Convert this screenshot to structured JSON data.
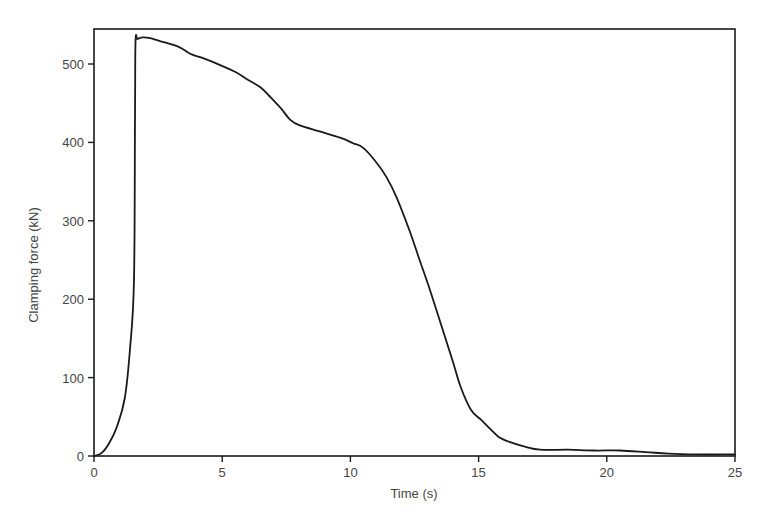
{
  "chart_data": {
    "type": "line",
    "title": "",
    "xlabel": "Time (s)",
    "ylabel": "Clamping force (kN)",
    "xlim": [
      0,
      25
    ],
    "ylim": [
      0,
      545
    ],
    "xticks": [
      0,
      5,
      10,
      15,
      20,
      25
    ],
    "yticks": [
      0,
      100,
      200,
      300,
      400,
      500
    ],
    "xtick_labels": [
      "0",
      "5",
      "10",
      "15",
      "20",
      "25"
    ],
    "ytick_labels": [
      "0",
      "100",
      "200",
      "300",
      "400",
      "500"
    ],
    "grid": false,
    "legend": null,
    "series": [
      {
        "name": "Clamping force",
        "color": "#1a1a1a",
        "x": [
          0.0,
          0.3,
          0.6,
          0.9,
          1.2,
          1.4,
          1.56,
          1.6,
          1.62,
          1.7,
          1.9,
          2.2,
          2.6,
          3.3,
          3.75,
          4.2,
          4.9,
          5.5,
          6.0,
          6.5,
          6.9,
          7.3,
          7.65,
          8.0,
          8.8,
          9.6,
          10.1,
          10.5,
          11.0,
          11.4,
          11.8,
          12.3,
          12.7,
          13.1,
          13.6,
          14.0,
          14.3,
          14.7,
          15.1,
          15.5,
          15.8,
          16.2,
          16.8,
          17.4,
          18.5,
          19.5,
          20.5,
          21.5,
          22.4,
          23.5,
          24.8,
          25.0
        ],
        "y": [
          0,
          4,
          17,
          38,
          74,
          135,
          225,
          430,
          528,
          532,
          534,
          533,
          529,
          522,
          513,
          508,
          499,
          490,
          480,
          470,
          457,
          443,
          429,
          422,
          414,
          406,
          399,
          393,
          375,
          356,
          330,
          288,
          250,
          212,
          161,
          120,
          88,
          59,
          46,
          33,
          24,
          18,
          12,
          8,
          8,
          7,
          7,
          5,
          3,
          2,
          2,
          2
        ]
      }
    ]
  },
  "caption": {
    "text": ""
  }
}
